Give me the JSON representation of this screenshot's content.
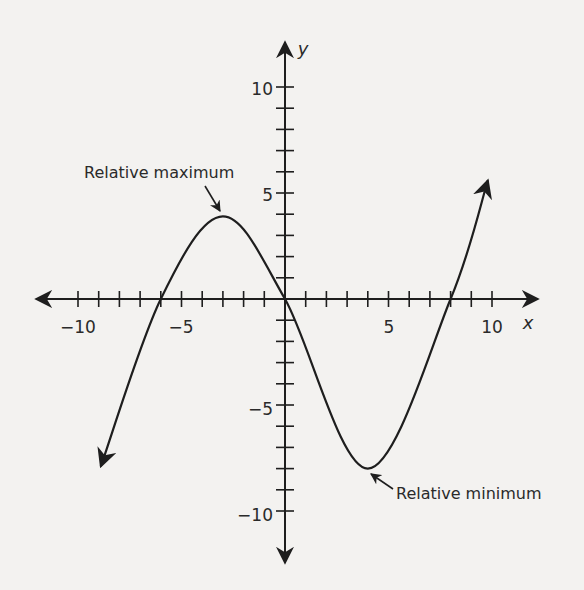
{
  "chart_data": {
    "type": "line",
    "title": "",
    "xlabel": "x",
    "ylabel": "y",
    "xlim": [
      -12,
      12
    ],
    "ylim": [
      -12,
      12
    ],
    "x_ticks": [
      -10,
      -5,
      5,
      10
    ],
    "y_ticks": [
      10,
      5,
      -5,
      -10
    ],
    "grid": false,
    "series": [
      {
        "name": "cubic function",
        "x": [
          -8.9,
          -6,
          -3,
          0,
          4,
          8,
          9.8
        ],
        "y": [
          -7.9,
          0,
          3.9,
          0,
          -8,
          0,
          5.6
        ]
      }
    ],
    "annotations": [
      {
        "text": "Relative maximum",
        "point": [
          -3,
          3.9
        ]
      },
      {
        "text": "Relative minimum",
        "point": [
          4,
          -8
        ]
      }
    ]
  },
  "labels": {
    "x_axis": "x",
    "y_axis": "y",
    "xt_m10": "−10",
    "xt_m5": "−5",
    "xt_5": "5",
    "xt_10": "10",
    "yt_10": "10",
    "yt_5": "5",
    "yt_m5": "−5",
    "yt_m10": "−10",
    "rel_max": "Relative maximum",
    "rel_min": "Relative minimum"
  }
}
